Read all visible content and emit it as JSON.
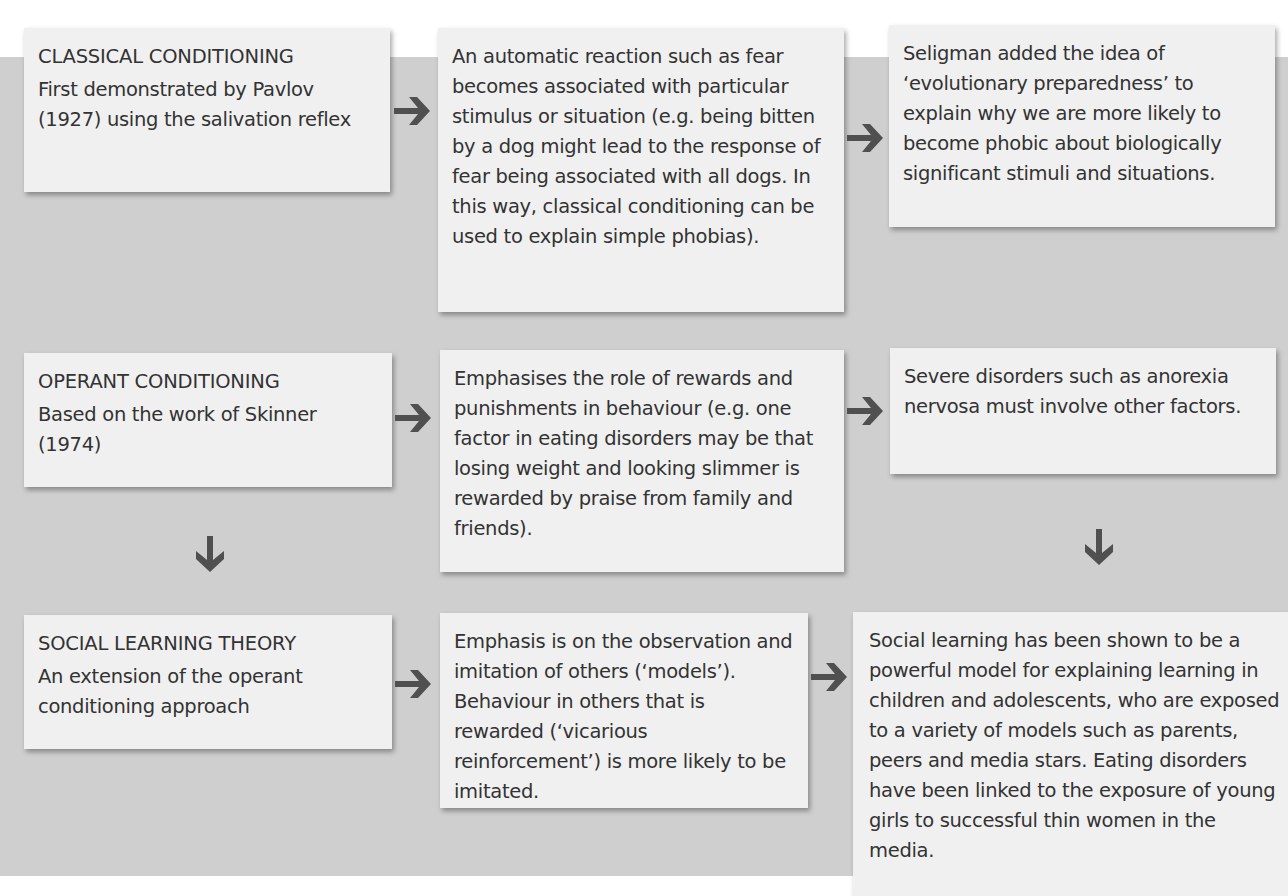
{
  "diagram": {
    "colors": {
      "background": "#ffffff",
      "panel": "#cfcfcf",
      "box": "#f0f0f0",
      "text": "#333333",
      "arrow": "#505050"
    },
    "rows": [
      {
        "approach": {
          "title": "Classical conditioning",
          "subtitle": "First demonstrated by Pavlov (1927) using the salivation reflex"
        },
        "explanation": "An automatic reaction such as fear becomes associated with particular stimulus or situation (e.g. being bitten by a dog might lead to the response of fear being associated with all dogs. In this way, classical conditioning can be used to explain simple phobias).",
        "evaluation": "Seligman added the idea of ‘evolutionary preparedness’ to explain why we are more likely to become phobic about biologically significant stimuli and situations."
      },
      {
        "approach": {
          "title": "Operant conditioning",
          "subtitle": "Based on the work of Skinner (1974)"
        },
        "explanation": "Emphasises the role of rewards and punishments in behaviour (e.g. one factor in eating disorders may be that losing weight and looking slimmer is rewarded by praise from family and friends).",
        "evaluation": "Severe disorders such as anorexia nervosa must involve other factors."
      },
      {
        "approach": {
          "title": "Social learning theory",
          "subtitle": "An extension of the operant conditioning approach"
        },
        "explanation": "Emphasis is on the observation and imitation of others (‘models’). Behaviour in others that is rewarded (‘vicarious reinforcement’) is more likely to be imitated.",
        "evaluation": "Social learning has been shown to be a powerful model for explaining learning in children and adolescents, who are exposed to a variety of models such as parents, peers and media stars. Eating disorders have been linked to the exposure of young girls to successful thin women in the media."
      }
    ],
    "arrows": [
      {
        "icon": "arrow-right-icon",
        "from": "classical-conditioning",
        "to": "classical-explanation"
      },
      {
        "icon": "arrow-right-icon",
        "from": "classical-explanation",
        "to": "classical-evaluation"
      },
      {
        "icon": "arrow-right-icon",
        "from": "operant-conditioning",
        "to": "operant-explanation"
      },
      {
        "icon": "arrow-right-icon",
        "from": "operant-explanation",
        "to": "operant-evaluation"
      },
      {
        "icon": "arrow-down-icon",
        "from": "operant-conditioning",
        "to": "social-learning-theory"
      },
      {
        "icon": "arrow-down-icon",
        "from": "operant-evaluation",
        "to": "social-learning-evaluation"
      },
      {
        "icon": "arrow-right-icon",
        "from": "social-learning-theory",
        "to": "social-learning-explanation"
      },
      {
        "icon": "arrow-right-icon",
        "from": "social-learning-explanation",
        "to": "social-learning-evaluation"
      }
    ]
  }
}
